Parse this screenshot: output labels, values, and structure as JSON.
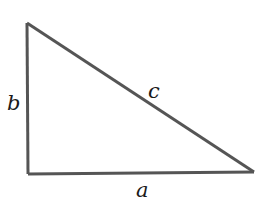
{
  "diagram": {
    "type": "right-triangle",
    "vertices": {
      "top": [
        27,
        23
      ],
      "right_angle": [
        28,
        174
      ],
      "right": [
        254,
        172
      ]
    },
    "labels": {
      "a": "a",
      "b": "b",
      "c": "c"
    },
    "stroke_color": "#555555"
  }
}
